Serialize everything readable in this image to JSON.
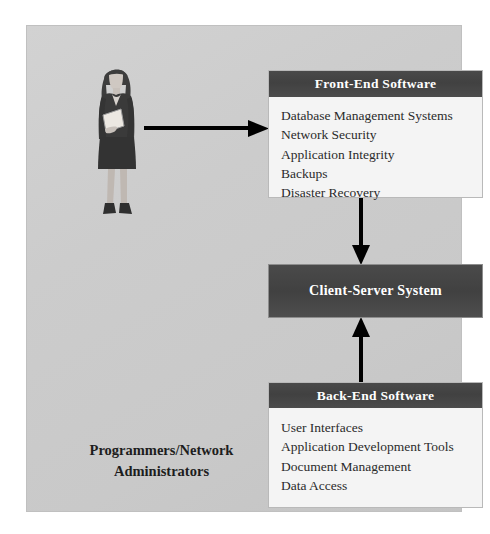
{
  "diagram": {
    "caption": {
      "line1": "Programmers/Network",
      "line2": "Administrators"
    },
    "person": {
      "label": "businesswoman-holding-folder"
    },
    "colors": {
      "panel_background": "#cccccc",
      "box_background": "#f4f4f4",
      "header_band": "#454545",
      "header_text": "#ffffff",
      "body_text": "#2b2b2b",
      "arrow": "#000000"
    },
    "boxes": [
      {
        "id": "front-end-software",
        "title": "Front-End Software",
        "items": [
          "Database Management Systems",
          "Network Security",
          "Application Integrity",
          "Backups",
          "Disaster Recovery"
        ]
      },
      {
        "id": "client-server-system",
        "title": "Client-Server System",
        "items": []
      },
      {
        "id": "back-end-software",
        "title": "Back-End Software",
        "items": [
          "User Interfaces",
          "Application Development Tools",
          "Document Management",
          "Data Access"
        ]
      }
    ],
    "arrows": [
      {
        "id": "person-to-front-end",
        "direction": "right"
      },
      {
        "id": "front-end-to-client-server",
        "direction": "down"
      },
      {
        "id": "back-end-to-client-server",
        "direction": "up"
      }
    ]
  }
}
